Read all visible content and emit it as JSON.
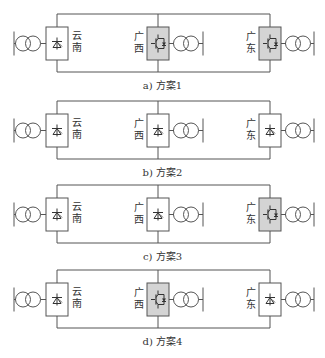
{
  "figure": {
    "nodes": {
      "yunnan": [
        "云",
        "南"
      ],
      "guangxi": [
        "广",
        "西"
      ],
      "guangdong": [
        "广",
        "东"
      ]
    },
    "schemes": [
      {
        "caption": "a) 方案1",
        "yunnan": "LCC",
        "guangxi": "VSC",
        "guangdong": "VSC"
      },
      {
        "caption": "b) 方案2",
        "yunnan": "LCC",
        "guangxi": "LCC",
        "guangdong": "LCC"
      },
      {
        "caption": "c) 方案3",
        "yunnan": "LCC",
        "guangxi": "LCC",
        "guangdong": "VSC"
      },
      {
        "caption": "d) 方案4",
        "yunnan": "LCC",
        "guangxi": "VSC",
        "guangdong": "LCC"
      }
    ],
    "colors": {
      "line": "#555555",
      "vsc_fill": "#d4d4d4",
      "lcc_fill": "#ffffff"
    },
    "icons": {
      "lcc": "thyristor-valve-icon",
      "vsc": "igbt-valve-icon",
      "transformer": "transformer-icon",
      "bus": "ac-bus-icon"
    }
  }
}
